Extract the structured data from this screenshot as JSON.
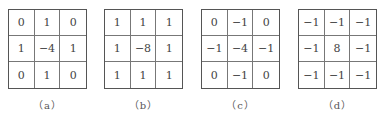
{
  "figure": {
    "panels": [
      {
        "label": "（a）",
        "matrix": [
          [
            "0",
            "1",
            "0"
          ],
          [
            "1",
            "−4",
            "1"
          ],
          [
            "0",
            "1",
            "0"
          ]
        ]
      },
      {
        "label": "（b）",
        "matrix": [
          [
            "1",
            "1",
            "1"
          ],
          [
            "1",
            "−8",
            "1"
          ],
          [
            "1",
            "1",
            "1"
          ]
        ]
      },
      {
        "label": "（c）",
        "matrix": [
          [
            "0",
            "−1",
            "0"
          ],
          [
            "−1",
            "−4",
            "−1"
          ],
          [
            "0",
            "−1",
            "0"
          ]
        ]
      },
      {
        "label": "（d）",
        "matrix": [
          [
            "−1",
            "−1",
            "−1"
          ],
          [
            "−1",
            "8",
            "−1"
          ],
          [
            "−1",
            "−1",
            "−1"
          ]
        ]
      }
    ]
  }
}
